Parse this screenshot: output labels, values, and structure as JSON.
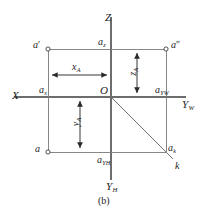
{
  "figure": {
    "caption": "(b)",
    "background_color": "#ffffff",
    "line_color": "#4a4a4a",
    "text_color": "#1b1b1b"
  },
  "axes": [
    {
      "id": "z-axis",
      "label": "Z",
      "prime": "",
      "sub": "",
      "direction": "up"
    },
    {
      "id": "x-axis",
      "label": "X",
      "prime": "",
      "sub": "",
      "direction": "left"
    },
    {
      "id": "yw-axis",
      "label": "Y",
      "prime": "",
      "sub": "W",
      "direction": "right"
    },
    {
      "id": "yh-axis",
      "label": "Y",
      "prime": "",
      "sub": "H",
      "direction": "down"
    }
  ],
  "origin": {
    "label": "O"
  },
  "points": [
    {
      "id": "a-front",
      "label": "a",
      "prime": "′",
      "sub": "",
      "marker": "circle"
    },
    {
      "id": "a-side",
      "label": "a",
      "prime": "″",
      "sub": "",
      "marker": "circle"
    },
    {
      "id": "a-top",
      "label": "a",
      "prime": "",
      "sub": "",
      "marker": "circle"
    },
    {
      "id": "a-z",
      "label": "a",
      "prime": "",
      "sub": "z",
      "marker": "none"
    },
    {
      "id": "a-x",
      "label": "a",
      "prime": "",
      "sub": "x",
      "marker": "none"
    },
    {
      "id": "a-yw",
      "label": "a",
      "prime": "",
      "sub": "YW",
      "marker": "none"
    },
    {
      "id": "a-yh",
      "label": "a",
      "prime": "",
      "sub": "YH",
      "marker": "none"
    },
    {
      "id": "a-k",
      "label": "a",
      "prime": "",
      "sub": "k",
      "marker": "none"
    },
    {
      "id": "k-bisector",
      "label": "k",
      "prime": "",
      "sub": "",
      "marker": "none"
    }
  ],
  "dimensions": [
    {
      "id": "x-dimension",
      "label": "x",
      "sub": "A",
      "orientation": "horizontal"
    },
    {
      "id": "z-dimension",
      "label": "z",
      "sub": "A",
      "orientation": "vertical"
    },
    {
      "id": "y-dimension",
      "label": "y",
      "sub": "A",
      "orientation": "vertical"
    }
  ]
}
